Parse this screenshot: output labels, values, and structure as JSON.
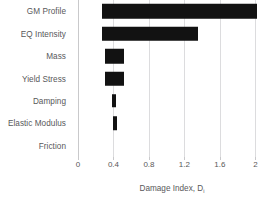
{
  "chart_data": {
    "type": "bar",
    "orientation": "horizontal",
    "subtype": "floating-range-bar",
    "title": "",
    "xlabel": "Damage Index, D",
    "xlabel_subscript": "i",
    "ylabel": "",
    "categories": [
      "GM Profile",
      "EQ Intensity",
      "Mass",
      "Yield Stress",
      "Damping",
      "Elastic Modulus",
      "Friction"
    ],
    "bar_start": [
      0.27,
      0.27,
      0.3,
      0.3,
      0.38,
      0.39,
      0.4
    ],
    "values": [
      2.02,
      1.35,
      0.52,
      0.52,
      0.43,
      0.44,
      0.4
    ],
    "bar_lengths": [
      1.75,
      1.08,
      0.22,
      0.22,
      0.05,
      0.05,
      0.0
    ],
    "xlim": [
      0,
      2.12
    ],
    "xticks": [
      0,
      0.4,
      0.8,
      1.2,
      1.6,
      2
    ],
    "xticklabels": [
      "0",
      "0.4",
      "0.8",
      "1.2",
      "1.6",
      "2"
    ],
    "grid": "vertical",
    "legend": "none",
    "bar_color": "#121212",
    "grid_color": "#dcdcde",
    "axis_color": "#c9c9cb",
    "text_color": "#58585a",
    "background": "#ffffff"
  }
}
